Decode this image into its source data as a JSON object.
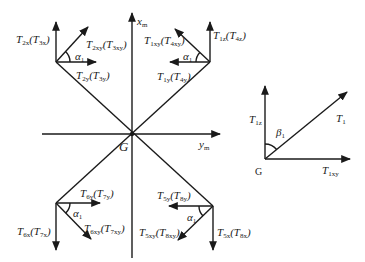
{
  "axes": {
    "x_label": "x",
    "x_sub": "m",
    "y_label": "y",
    "y_sub": "m",
    "origin_label": "G"
  },
  "quadrants": {
    "top_left": {
      "vertical": {
        "main": "T",
        "sub": "2x",
        "alt": "T",
        "alt_sub": "3x"
      },
      "diagonal": {
        "main": "T",
        "sub": "2xy",
        "alt": "T",
        "alt_sub": "3xy"
      },
      "horizontal": {
        "main": "T",
        "sub": "2y",
        "alt": "T",
        "alt_sub": "3y"
      },
      "angle": {
        "main": "α",
        "sub": "1"
      }
    },
    "top_right": {
      "vertical": {
        "main": "T",
        "sub": "1z",
        "alt": "T",
        "alt_sub": "4z"
      },
      "diagonal": {
        "main": "T",
        "sub": "1xy",
        "alt": "T",
        "alt_sub": "4xy"
      },
      "horizontal": {
        "main": "T",
        "sub": "1y",
        "alt": "T",
        "alt_sub": "4y"
      },
      "angle": {
        "main": "α",
        "sub": "1"
      }
    },
    "bottom_left": {
      "vertical": {
        "main": "T",
        "sub": "6x",
        "alt": "T",
        "alt_sub": "7x"
      },
      "diagonal": {
        "main": "T",
        "sub": "6xy",
        "alt": "T",
        "alt_sub": "7xy"
      },
      "horizontal": {
        "main": "T",
        "sub": "6y",
        "alt": "T",
        "alt_sub": "7y"
      },
      "angle": {
        "main": "α",
        "sub": "1"
      }
    },
    "bottom_right": {
      "vertical": {
        "main": "T",
        "sub": "5x",
        "alt": "T",
        "alt_sub": "8x"
      },
      "diagonal": {
        "main": "T",
        "sub": "5xy",
        "alt": "T",
        "alt_sub": "8xy"
      },
      "horizontal": {
        "main": "T",
        "sub": "5y",
        "alt": "T",
        "alt_sub": "8y"
      },
      "angle": {
        "main": "α",
        "sub": "1"
      }
    }
  },
  "inset": {
    "vertical": {
      "main": "T",
      "sub": "1z"
    },
    "resultant": {
      "main": "T",
      "sub": "1"
    },
    "horizontal": {
      "main": "T",
      "sub": "1xy"
    },
    "angle": {
      "main": "β",
      "sub": "1"
    },
    "origin_label": "G"
  },
  "colors": {
    "line": "#1a1a1a",
    "background": "#ffffff"
  }
}
